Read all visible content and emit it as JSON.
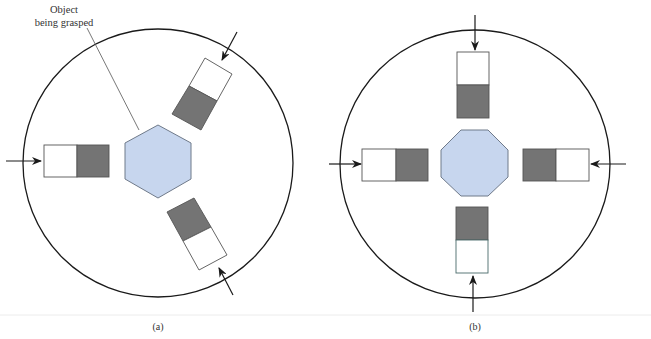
{
  "colors": {
    "object_fill": "#c7d6ee",
    "object_stroke": "#6f7a8a",
    "pad_dark": "#747474",
    "pad_light": "#ffffff",
    "outline": "#333333",
    "circle": "#1a1a1a",
    "separator": "#ececec"
  },
  "annotation": {
    "line1": "Object",
    "line2": "being grasped"
  },
  "panels": [
    {
      "id": "a",
      "caption": "(a)",
      "object_shape": "hexagon",
      "gripper_count": 3
    },
    {
      "id": "b",
      "caption": "(b)",
      "object_shape": "octagon",
      "gripper_count": 4
    }
  ]
}
